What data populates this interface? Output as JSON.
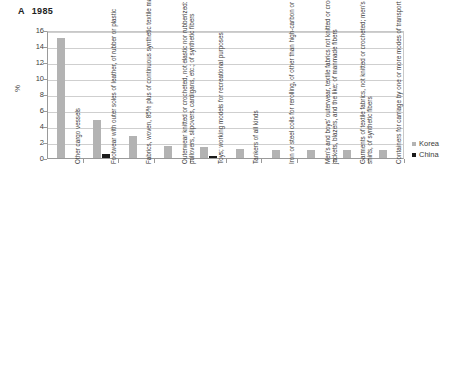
{
  "chart_data": {
    "type": "bar",
    "title_letter": "A",
    "title_year": "1985",
    "xlabel": "",
    "ylabel": "%",
    "ylim": [
      0,
      16
    ],
    "yticks": [
      0,
      2,
      4,
      6,
      8,
      10,
      12,
      14,
      16
    ],
    "grid": true,
    "legend_position": "right",
    "colors": {
      "korea": "#b3b3b3",
      "china": "#1a1a1a"
    },
    "categories": [
      "Other cargo vessels",
      "Footwear with outer soles of leather, of rubber or plastic",
      "Fabrics, woven, 85% plus of continuous synthetic textile materials",
      "Outerwear knitted or crocheted, not elastic nor rubberized: jerseys, pullovers, slipovers, cardigans, etc.; of synthetic fibers",
      "Toys; working models for recreational purposes",
      "Tankers of all kinds",
      "Iron or steel coils for rerolling, of other than high-carbon or alloy steel",
      "Men's and boys' outerwear, textile fabrics not knitted or crocheted; jackets, blazers, and the like; of manmade fibers",
      "Garments of textile fabrics, not knitted or crocheted; men's and boys' shirts, of synthetic fibers",
      "Containers for carriage by one or more modes of transport"
    ],
    "series": [
      {
        "name": "Korea",
        "values": [
          15.0,
          4.7,
          2.7,
          1.5,
          1.4,
          1.1,
          1.0,
          0.95,
          0.95,
          0.95
        ]
      },
      {
        "name": "China",
        "values": [
          0,
          0.5,
          0,
          0,
          0.3,
          0,
          0,
          0,
          0,
          0
        ]
      }
    ]
  },
  "legend": {
    "entries": [
      {
        "label": "Korea",
        "color": "#b3b3b3"
      },
      {
        "label": "China",
        "color": "#1a1a1a"
      }
    ]
  }
}
